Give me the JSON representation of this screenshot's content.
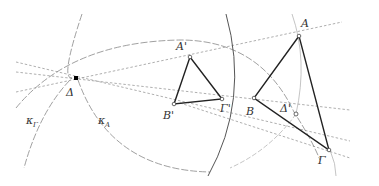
{
  "diagram": {
    "type": "geometric-construction",
    "colors": {
      "triangle": "#222222",
      "dashed_line": "#999999",
      "arc": "#777777",
      "solid_arc": "#555555",
      "point_fill": "#000000",
      "label": "#333333"
    },
    "points": {
      "Delta": {
        "label": "Δ",
        "x": 76,
        "y": 78
      },
      "A_prime": {
        "label": "A'",
        "x": 190,
        "y": 57
      },
      "B_prime": {
        "label": "B'",
        "x": 174,
        "y": 104
      },
      "Gamma_prime": {
        "label": "Γ'",
        "x": 222,
        "y": 99
      },
      "A": {
        "label": "A",
        "x": 299,
        "y": 36
      },
      "B": {
        "label": "B",
        "x": 254,
        "y": 98
      },
      "Gamma": {
        "label": "Γ",
        "x": 329,
        "y": 150
      },
      "Delta_prime": {
        "label": "Δ'",
        "x": 296,
        "y": 114
      }
    },
    "labels": {
      "Delta": "Δ",
      "A_prime": "A'",
      "B_prime": "B'",
      "Gamma_prime": "Γ'",
      "A": "A",
      "B": "B",
      "Gamma": "Γ",
      "Delta_prime": "Δ'",
      "kappa_Gamma": "κ",
      "kappa_Gamma_sub": "Γ",
      "kappa_A": "κ",
      "kappa_A_sub": "A"
    },
    "triangles": [
      {
        "name": "small-triangle",
        "vertices": [
          "A_prime",
          "B_prime",
          "Gamma_prime"
        ]
      },
      {
        "name": "large-triangle",
        "vertices": [
          "A",
          "B",
          "Gamma"
        ]
      }
    ],
    "circles": [
      {
        "name": "kappa-Gamma",
        "label": "κΓ"
      },
      {
        "name": "kappa-A",
        "label": "κA"
      }
    ]
  }
}
